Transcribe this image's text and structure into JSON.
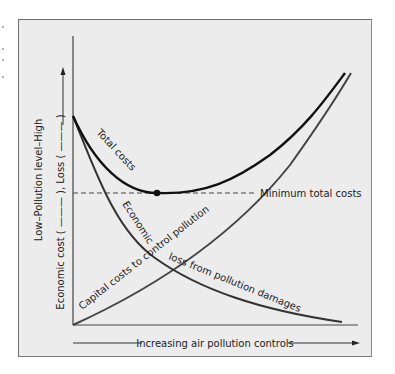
{
  "figure": {
    "y_axis": {
      "label_outer": "Low–Pollution level–High",
      "label_inner": "Economic cost ( ——— ), Loss ( ——— )"
    },
    "x_axis": {
      "label": "Increasing air pollution controls"
    },
    "curves": {
      "total_costs": "Total costs",
      "capital_costs": "Capital costs to control pollution",
      "economic_loss_part1": "Economic",
      "economic_loss_part2": "loss from pollution damages"
    },
    "annotation": {
      "minimum": "Minimum total costs"
    },
    "colors": {
      "background": "#ececec",
      "frame": "#6e6e6e",
      "total_costs_line": "#111111",
      "capital_costs_line": "#444444",
      "loss_line": "#333333"
    }
  }
}
